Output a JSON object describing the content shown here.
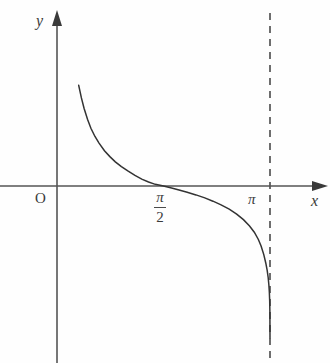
{
  "figure": {
    "background_color": "#fefefe",
    "axis_color": "#555555",
    "curve_color": "#333333",
    "asymptote_color": "#555555",
    "text_color": "#3a3a3a"
  },
  "labels": {
    "y_axis_name": "y",
    "x_axis_name": "x",
    "origin": "O",
    "pi_tick": "π",
    "pi_over_2_numerator": "π",
    "pi_over_2_denominator": "2"
  },
  "chart_data": {
    "type": "line",
    "title": "",
    "xlabel": "x",
    "ylabel": "y",
    "grid": false,
    "legend": "none",
    "function": "y = cot(x)",
    "xlim": [
      -0.25,
      4.15
    ],
    "ylim": [
      -4.65,
      5.6
    ],
    "x_ticks": [
      {
        "value": 0,
        "label": "O"
      },
      {
        "value": 1.5708,
        "label": "π/2"
      },
      {
        "value": 3.1416,
        "label": "π"
      }
    ],
    "y_ticks": [],
    "annotations": [
      {
        "type": "vertical-asymptote",
        "x": 3.1416,
        "style": "dashed",
        "label": "π"
      },
      {
        "type": "vertical-asymptote",
        "x": 0,
        "style": "implicit-y-axis"
      },
      {
        "type": "zero-crossing",
        "x": 1.5708,
        "y": 0
      }
    ],
    "series": [
      {
        "name": "cot(x)",
        "points": [
          [
            0.32,
            3.05
          ],
          [
            0.36,
            2.67
          ],
          [
            0.4,
            2.35
          ],
          [
            0.45,
            2.02
          ],
          [
            0.5,
            1.75
          ],
          [
            0.56,
            1.5
          ],
          [
            0.62,
            1.3
          ],
          [
            0.7,
            1.07
          ],
          [
            0.78,
            0.89
          ],
          [
            0.86,
            0.73
          ],
          [
            0.95,
            0.59
          ],
          [
            1.05,
            0.45
          ],
          [
            1.15,
            0.32
          ],
          [
            1.25,
            0.21
          ],
          [
            1.35,
            0.12
          ],
          [
            1.45,
            0.05
          ],
          [
            1.5708,
            0.0
          ],
          [
            1.69,
            -0.06
          ],
          [
            1.8,
            -0.12
          ],
          [
            1.92,
            -0.19
          ],
          [
            2.05,
            -0.27
          ],
          [
            2.18,
            -0.36
          ],
          [
            2.3,
            -0.46
          ],
          [
            2.42,
            -0.57
          ],
          [
            2.54,
            -0.7
          ],
          [
            2.65,
            -0.85
          ],
          [
            2.75,
            -1.02
          ],
          [
            2.84,
            -1.21
          ],
          [
            2.91,
            -1.4
          ],
          [
            2.97,
            -1.62
          ],
          [
            3.01,
            -1.82
          ],
          [
            3.05,
            -2.08
          ],
          [
            3.08,
            -2.34
          ],
          [
            3.1,
            -2.56
          ],
          [
            3.115,
            -2.78
          ],
          [
            3.125,
            -3.0
          ],
          [
            3.132,
            -3.22
          ],
          [
            3.137,
            -3.48
          ],
          [
            3.14,
            -3.8
          ],
          [
            3.1416,
            -4.6
          ]
        ]
      }
    ]
  }
}
